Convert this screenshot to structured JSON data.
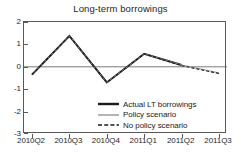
{
  "chart_data": {
    "type": "line",
    "title": "Long-term borrowings",
    "xlabel": "",
    "ylabel": "",
    "categories": [
      "2010Q2",
      "2010Q3",
      "2010Q4",
      "2011Q1",
      "2011Q2",
      "2011Q3"
    ],
    "ylim": [
      -3,
      2
    ],
    "yticks": [
      2,
      1,
      0,
      -1,
      -2,
      -3
    ],
    "ytick_labels": [
      "2",
      "1",
      "0",
      "-1",
      "-2",
      "-3"
    ],
    "grid": false,
    "zero_line": true,
    "legend_position": "bottom-right",
    "series": [
      {
        "name": "Actual LT borrowings",
        "style": "solid-thick",
        "color": "#1a1a1a",
        "values": [
          -0.35,
          1.38,
          -0.7,
          0.58,
          0.08,
          null
        ]
      },
      {
        "name": "Policy scenario",
        "style": "solid-thin",
        "color": "#8c8c8c",
        "values": [
          -0.35,
          1.38,
          -0.7,
          0.58,
          0.08,
          -0.27
        ]
      },
      {
        "name": "No policy scenario",
        "style": "dashed",
        "color": "#1a1a1a",
        "values": [
          -0.35,
          1.38,
          -0.7,
          0.58,
          0.05,
          -0.3
        ]
      }
    ]
  },
  "legend": {
    "items": [
      {
        "label": "Actual LT borrowings"
      },
      {
        "label": "Policy scenario"
      },
      {
        "label": "No policy scenario"
      }
    ]
  }
}
